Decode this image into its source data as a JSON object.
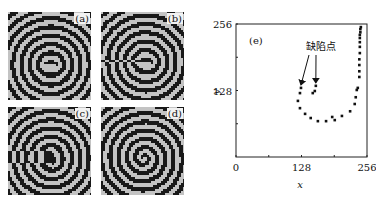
{
  "panels": [
    {
      "label": "(a)",
      "description": "spiral wave with two adjacent cores"
    },
    {
      "label": "(b)",
      "description": "spiral wave, defect cores merging, edge disturbance top-right"
    },
    {
      "label": "(c)",
      "description": "spiral wave with defect near core"
    },
    {
      "label": "(d)",
      "description": "single spiral wave"
    }
  ],
  "chart_data": {
    "type": "scatter",
    "title": "",
    "panel_label": "(e)",
    "xlabel": "x",
    "ylabel": "y",
    "xlim": [
      0,
      256
    ],
    "ylim": [
      0,
      256
    ],
    "xticks": [
      0,
      128,
      256
    ],
    "yticks": [
      128,
      256
    ],
    "minor_ticks": [
      64,
      192
    ],
    "grid": false,
    "legend": null,
    "annotation": {
      "text": "缺陷点",
      "arrows": [
        {
          "target": [
            127,
            133
          ]
        },
        {
          "target": [
            156,
            137
          ]
        }
      ]
    },
    "series": [
      {
        "name": "spiral-tip trajectory",
        "points": [
          [
            127,
            133
          ],
          [
            125,
            123
          ],
          [
            121,
            108
          ],
          [
            125,
            94
          ],
          [
            135,
            83
          ],
          [
            146,
            75
          ],
          [
            160,
            69
          ],
          [
            176,
            69
          ],
          [
            188,
            77
          ],
          [
            193,
            71
          ],
          [
            207,
            79
          ],
          [
            223,
            88
          ],
          [
            232,
            102
          ],
          [
            234,
            115
          ],
          [
            236,
            129
          ],
          [
            238,
            133
          ],
          [
            241,
            154
          ],
          [
            241,
            165
          ],
          [
            241,
            177
          ],
          [
            241,
            188
          ],
          [
            242,
            200
          ],
          [
            242,
            212
          ],
          [
            242,
            221
          ],
          [
            242,
            229
          ],
          [
            242,
            235
          ],
          [
            243,
            240
          ],
          [
            243,
            246
          ],
          [
            244,
            250
          ]
        ]
      },
      {
        "name": "defect point",
        "points": [
          [
            156,
            137
          ],
          [
            154,
            127
          ],
          [
            150,
            123
          ]
        ]
      }
    ]
  }
}
